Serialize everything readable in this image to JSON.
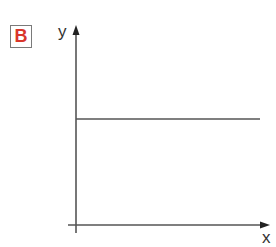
{
  "panel": {
    "label": "B",
    "label_color": "#d9362b",
    "border_color": "#7a7a7a"
  },
  "chart_data": {
    "type": "line",
    "title": "",
    "xlabel": "x",
    "ylabel": "y",
    "x_ticks": [],
    "y_ticks": [],
    "grid": false,
    "legend": "none",
    "xlim": [
      0,
      1
    ],
    "ylim": [
      0,
      1
    ],
    "series": [
      {
        "name": "constant",
        "x": [
          0,
          0.92
        ],
        "y": [
          0.53,
          0.53
        ],
        "color": "#555555"
      }
    ],
    "axis_color": "#555555"
  }
}
